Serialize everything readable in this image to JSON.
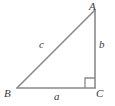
{
  "figure": {
    "name": "right-triangle",
    "width": 115,
    "height": 106,
    "background_color": "#ffffff",
    "line_color": "#8a8a8a",
    "label_color": "#3a3a3a"
  },
  "vertices": [
    {
      "id": "A",
      "label": "A",
      "x": 95,
      "y": 10
    },
    {
      "id": "B",
      "label": "B",
      "x": 17,
      "y": 88
    },
    {
      "id": "C",
      "label": "C",
      "x": 95,
      "y": 88
    }
  ],
  "sides": [
    {
      "id": "a",
      "label": "a",
      "from": "B",
      "to": "C",
      "role": "base"
    },
    {
      "id": "b",
      "label": "b",
      "from": "A",
      "to": "C",
      "role": "vertical-leg"
    },
    {
      "id": "c",
      "label": "c",
      "from": "B",
      "to": "A",
      "role": "hypotenuse"
    }
  ],
  "markers": [
    {
      "id": "right-angle",
      "at_vertex": "C",
      "size": 10,
      "type": "square"
    }
  ]
}
